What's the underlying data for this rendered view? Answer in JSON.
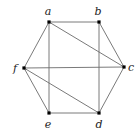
{
  "diagram": {
    "type": "graph",
    "colors": {
      "edge": "#6b6b6b",
      "vertex": "#000000",
      "label": "#222222"
    },
    "vertices": [
      {
        "id": "a",
        "label": "a",
        "x": 49,
        "y": 22,
        "lx": 48,
        "ly": 15
      },
      {
        "id": "b",
        "label": "b",
        "x": 99,
        "y": 22,
        "lx": 98,
        "ly": 15
      },
      {
        "id": "c",
        "label": "c",
        "x": 124,
        "y": 67,
        "lx": 131,
        "ly": 71
      },
      {
        "id": "d",
        "label": "d",
        "x": 99,
        "y": 113,
        "lx": 99,
        "ly": 128
      },
      {
        "id": "e",
        "label": "e",
        "x": 49,
        "y": 113,
        "lx": 48,
        "ly": 128
      },
      {
        "id": "f",
        "label": "f",
        "x": 24,
        "y": 68,
        "lx": 15,
        "ly": 72
      }
    ],
    "edges": [
      [
        "a",
        "b"
      ],
      [
        "b",
        "c"
      ],
      [
        "c",
        "d"
      ],
      [
        "d",
        "e"
      ],
      [
        "e",
        "f"
      ],
      [
        "f",
        "a"
      ],
      [
        "a",
        "e"
      ],
      [
        "b",
        "d"
      ],
      [
        "a",
        "c"
      ],
      [
        "f",
        "d"
      ],
      [
        "f",
        "c"
      ]
    ]
  }
}
